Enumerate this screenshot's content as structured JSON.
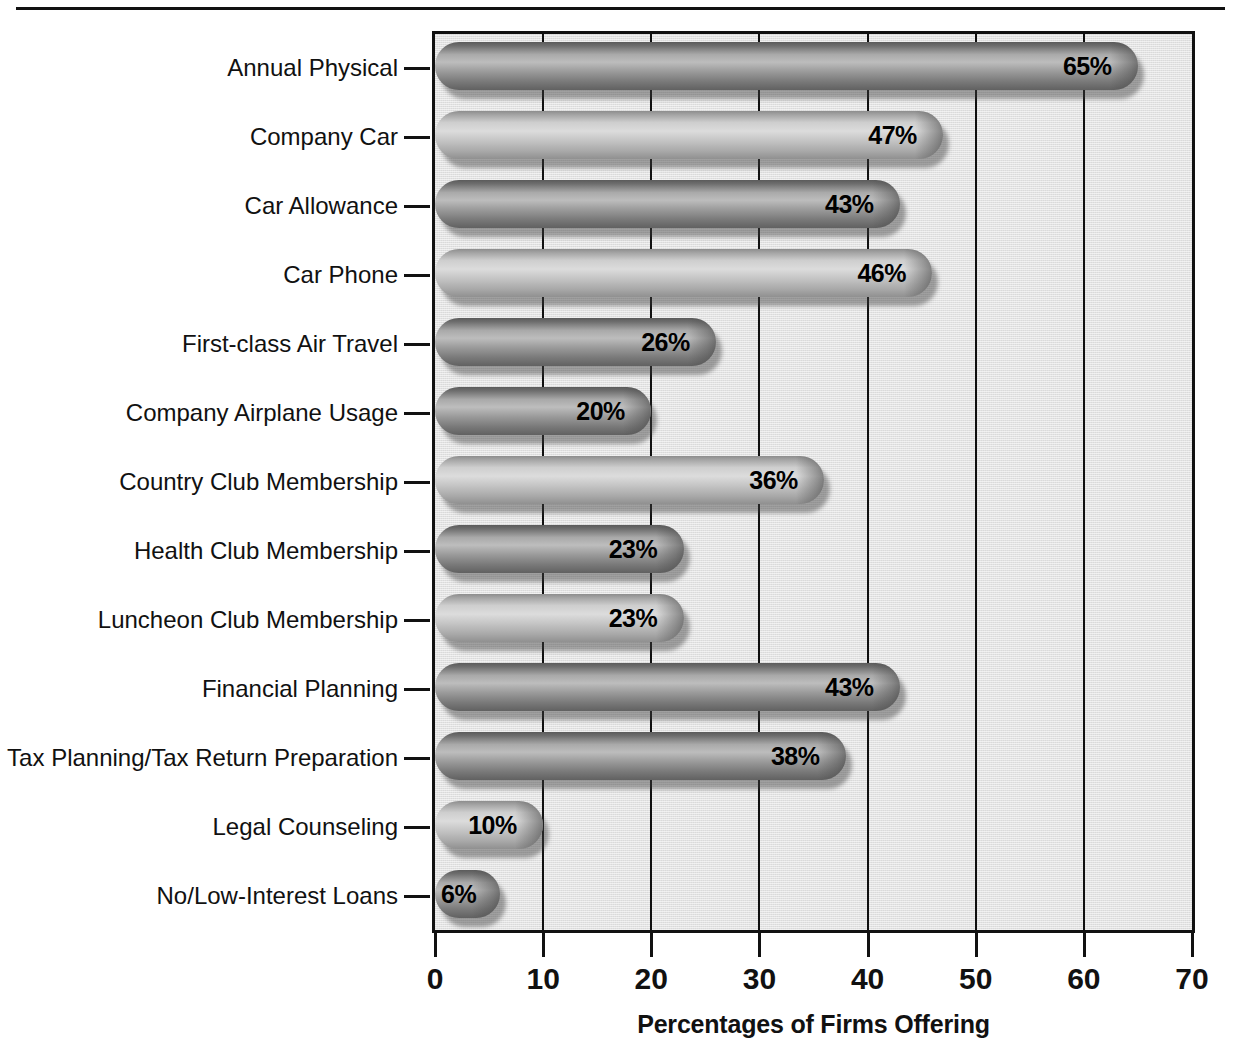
{
  "chart_data": {
    "type": "bar",
    "orientation": "horizontal",
    "title": "",
    "xlabel": "Percentages of Firms Offering",
    "ylabel": "",
    "xlim": [
      0,
      70
    ],
    "xticks": [
      0,
      10,
      20,
      30,
      40,
      50,
      60,
      70
    ],
    "xticklabels": [
      "0",
      "10",
      "20",
      "30",
      "40",
      "50",
      "60",
      "70"
    ],
    "grid": true,
    "grid_axis": "x",
    "legend": "none",
    "value_label_suffix": "%",
    "categories": [
      "Annual Physical",
      "Company Car",
      "Car Allowance",
      "Car Phone",
      "First-class Air Travel",
      "Company Airplane Usage",
      "Country Club Membership",
      "Health Club Membership",
      "Luncheon Club Membership",
      "Financial Planning",
      "Tax Planning/Tax Return Preparation",
      "Legal Counseling",
      "No/Low-Interest Loans"
    ],
    "values": [
      65,
      47,
      43,
      46,
      26,
      20,
      36,
      23,
      23,
      43,
      38,
      10,
      6
    ],
    "value_labels": [
      "65%",
      "47%",
      "43%",
      "46%",
      "26%",
      "20%",
      "36%",
      "23%",
      "23%",
      "43%",
      "38%",
      "10%",
      "6%"
    ],
    "bar_shades": [
      "dark",
      "light",
      "dark",
      "light",
      "dark",
      "dark",
      "light",
      "dark",
      "light",
      "dark",
      "dark",
      "light",
      "dark"
    ]
  },
  "colors": {
    "plot_background": "#e2e2e2",
    "axis": "#111111",
    "bar_dark": "#8f8f8f",
    "bar_light": "#c8c8c8",
    "text": "#111111"
  }
}
